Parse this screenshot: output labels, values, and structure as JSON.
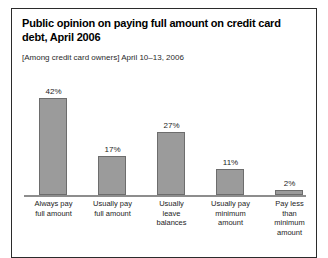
{
  "figure": {
    "title": "Public opinion on paying full amount on credit card debt, April 2006",
    "subtitle": "[Among credit card owners] April 10–13, 2006",
    "border_color": "#2b2b2b",
    "background_color": "#ffffff"
  },
  "chart_data": {
    "type": "bar",
    "title": "Public opinion on paying full amount on credit card debt, April 2006",
    "subtitle": "[Among credit card owners] April 10–13, 2006",
    "categories": [
      "Always pay full amount",
      "Usually pay full amount",
      "Usually leave balances",
      "Usually pay minimum amount",
      "Pay less than minimum amount"
    ],
    "category_lines": [
      "Always pay\nfull amount",
      "Usually pay\nfull amount",
      "Usually\nleave\nbalances",
      "Usually pay\nminimum\namount",
      "Pay less\nthan\nminimum\namount"
    ],
    "values": [
      42,
      17,
      27,
      11,
      2
    ],
    "value_labels": [
      "42%",
      "17%",
      "27%",
      "11%",
      "2%"
    ],
    "xlabel": "",
    "ylabel": "",
    "ylim": [
      0,
      50
    ],
    "grid": false,
    "legend": false,
    "bar_color": "#9b9b9b",
    "bar_edge_color": "#6d6d6d",
    "axis_color": "#8d8d8d"
  }
}
